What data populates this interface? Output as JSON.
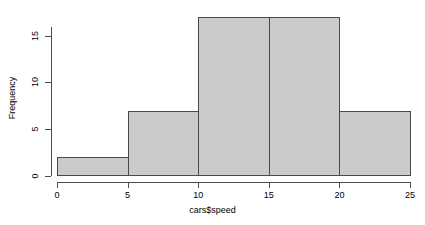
{
  "chart_data": {
    "type": "bar",
    "title": "",
    "subtitle": "",
    "xlabel": "cars$speed",
    "ylabel": "Frequency",
    "bin_edges": [
      0,
      5,
      10,
      15,
      20,
      25
    ],
    "categories": [
      "0-5",
      "5-10",
      "10-15",
      "15-20",
      "20-25"
    ],
    "values": [
      2,
      7,
      17,
      17,
      7
    ],
    "xlim": [
      0,
      25
    ],
    "ylim": [
      0,
      17
    ],
    "x_ticks": [
      0,
      5,
      10,
      15,
      20,
      25
    ],
    "x_tick_labels": [
      "0",
      "5",
      "10",
      "15",
      "20",
      "25"
    ],
    "y_ticks": [
      0,
      5,
      10,
      15
    ],
    "y_tick_labels": [
      "0",
      "5",
      "10",
      "15"
    ],
    "grid": false,
    "legend": false,
    "legend_position": "none",
    "bar_fill_color": "#cbcbcb",
    "bar_border_color": "#4a4a4a",
    "axis_color": "#4d4d4d",
    "background_color": "#ffffff"
  }
}
